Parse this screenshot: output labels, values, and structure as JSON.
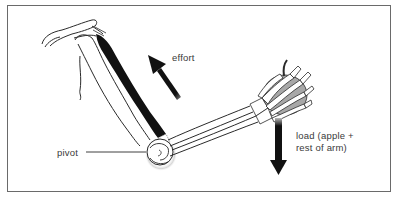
{
  "diagram": {
    "type": "biology-lever-diagram",
    "labels": {
      "effort": "effort",
      "pivot": "pivot",
      "load_line1": "load (apple +",
      "load_line2": "rest of arm)"
    },
    "colors": {
      "ink": "#111111",
      "outline": "#2a2a2a",
      "frame": "#6a6a6a",
      "background": "#ffffff",
      "apple_shade": "#9a9a9a"
    },
    "elements": [
      {
        "name": "shoulder-blade",
        "kind": "bone"
      },
      {
        "name": "humerus",
        "kind": "bone"
      },
      {
        "name": "biceps-muscle",
        "kind": "muscle"
      },
      {
        "name": "elbow-joint",
        "kind": "joint",
        "label": "pivot"
      },
      {
        "name": "forearm-bones",
        "kind": "bone"
      },
      {
        "name": "hand-bones",
        "kind": "bone"
      },
      {
        "name": "apple",
        "kind": "object"
      },
      {
        "name": "effort-arrow",
        "kind": "arrow",
        "direction": "up-left",
        "label": "effort"
      },
      {
        "name": "load-arrow",
        "kind": "arrow",
        "direction": "down",
        "label": "load (apple + rest of arm)"
      }
    ]
  }
}
